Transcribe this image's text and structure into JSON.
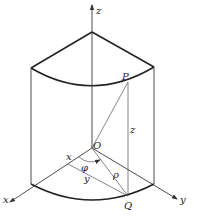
{
  "figure": {
    "labels": {
      "z_axis": "z",
      "x_axis": "x",
      "y_axis": "y",
      "origin": "O",
      "point_p": "P",
      "point_q": "Q",
      "height": "z",
      "x_coord": "x",
      "y_coord": "y",
      "radius": "ρ",
      "angle": "φ"
    },
    "colors": {
      "stroke": "#3a3a3a",
      "background": "#ffffff"
    }
  }
}
